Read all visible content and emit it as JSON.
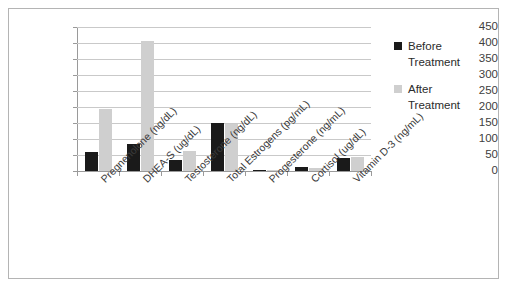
{
  "chart_data": {
    "type": "bar",
    "title": "",
    "xlabel": "",
    "ylabel": "",
    "ylim": [
      0,
      450
    ],
    "ytick_step": 50,
    "yticks": [
      "450",
      "400",
      "350",
      "300",
      "250",
      "200",
      "150",
      "100",
      "50",
      "0"
    ],
    "grid": true,
    "legend_position": "right",
    "categories": [
      "Pregnenolone (ng/dL)",
      "DHEA-S (ug/dL)",
      "Testosterone (ng/dL)",
      "Total Estrogens (pg/mL)",
      "Progesterone (ng/mL)",
      "Cortisol (ug/dL)",
      "Vitamin D-3 (ng/mL)"
    ],
    "series": [
      {
        "name": "Before Treatment",
        "color": "#1a1a1a",
        "values": [
          60,
          85,
          35,
          150,
          2,
          13,
          42
        ]
      },
      {
        "name": "After Treatment",
        "color": "#cfcfcf",
        "values": [
          195,
          405,
          62,
          148,
          3,
          10,
          44
        ]
      }
    ]
  },
  "legend": {
    "entries": [
      {
        "label_line1": "Before",
        "label_line2": "Treatment",
        "swatch": "before-swatch"
      },
      {
        "label_line1": "After",
        "label_line2": "Treatment",
        "swatch": "after-swatch"
      }
    ]
  },
  "colors": {
    "before": "#1a1a1a",
    "after": "#cfcfcf",
    "grid": "#c9c9c9",
    "axis": "#9a9a9a",
    "border": "#b4b4b4",
    "text": "#3a3a3a",
    "background": "#ffffff"
  }
}
